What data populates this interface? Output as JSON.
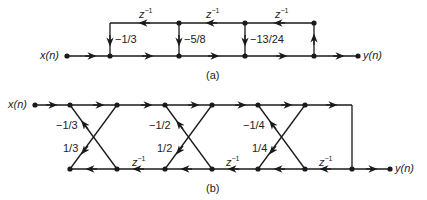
{
  "figure_a": {
    "caption": "(a)",
    "input_label": "x(n)",
    "output_label": "y(n)",
    "delay_labels": [
      "z",
      "z",
      "z"
    ],
    "delay_exponent": "−1",
    "coefficients": [
      "−1/3",
      "−5/8",
      "−13/24"
    ]
  },
  "figure_b": {
    "caption": "(b)",
    "input_label": "x(n)",
    "output_label": "y(n)",
    "delay_labels": [
      "z",
      "z",
      "z"
    ],
    "delay_exponent": "−1",
    "upper_coefficients": [
      "−1/3",
      "−1/2",
      "−1/4"
    ],
    "lower_coefficients": [
      "1/3",
      "1/2",
      "1/4"
    ]
  },
  "colors": {
    "line": "#1a1a1a",
    "background": "#ffffff"
  }
}
